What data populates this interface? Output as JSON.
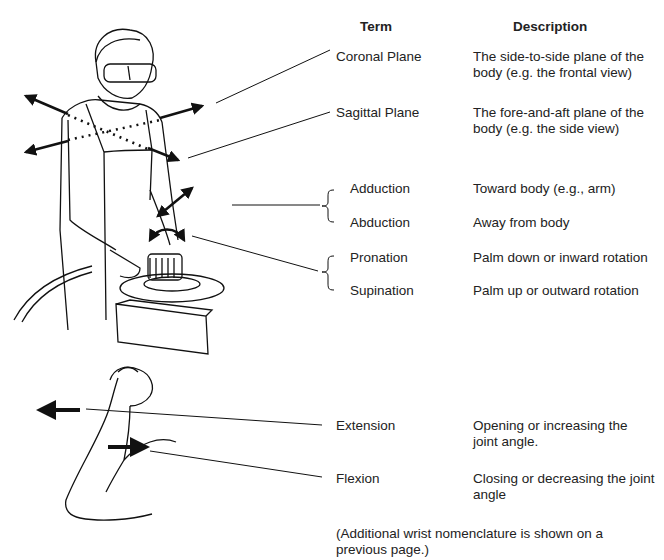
{
  "table": {
    "headers": {
      "term": "Term",
      "description": "Description"
    },
    "rows": [
      {
        "term": "Coronal Plane",
        "description": "The side-to-side plane of the body (e.g. the frontal view)"
      },
      {
        "term": "Sagittal Plane",
        "description": "The fore-and-aft plane of the body (e.g. the side view)"
      },
      {
        "term": "Adduction",
        "description": "Toward body (e.g., arm)"
      },
      {
        "term": "Abduction",
        "description": "Away from body"
      },
      {
        "term": "Pronation",
        "description": "Palm down or inward rotation"
      },
      {
        "term": "Supination",
        "description": "Palm up or outward rotation"
      },
      {
        "term": "Extension",
        "description": "Opening or increasing the joint angle."
      },
      {
        "term": "Flexion",
        "description": "Closing or decreasing the joint angle"
      }
    ]
  },
  "footnote": "(Additional wrist nomenclature is shown on a previous page.)",
  "figures": {
    "top": "worker-with-sander-illustration",
    "bottom": "flexed-arm-illustration"
  }
}
